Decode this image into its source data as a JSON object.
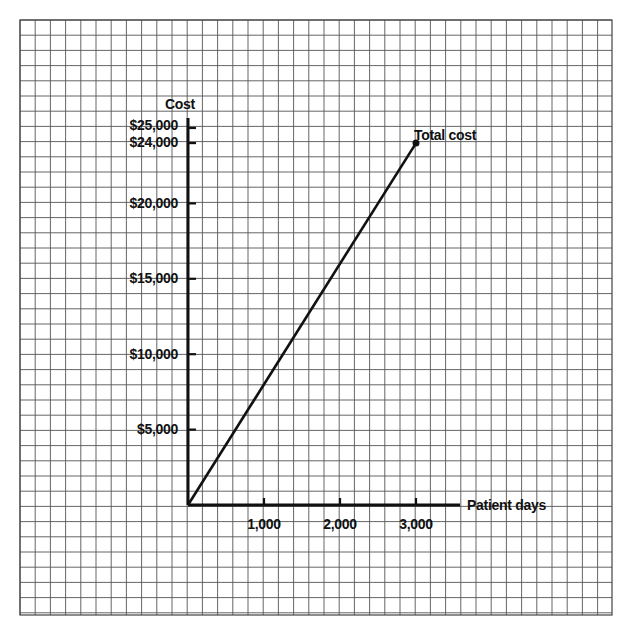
{
  "chart_data": {
    "type": "line",
    "title": "",
    "xlabel": "Patient days",
    "ylabel": "Cost",
    "x_ticks": [
      "1,000",
      "2,000",
      "3,000"
    ],
    "x_tick_values": [
      1000,
      2000,
      3000
    ],
    "y_ticks": [
      "$5,000",
      "$10,000",
      "$15,000",
      "$20,000",
      "$24,000",
      "$25,000"
    ],
    "y_tick_values": [
      5000,
      10000,
      15000,
      20000,
      24000,
      25000
    ],
    "xlim": [
      0,
      3500
    ],
    "ylim": [
      0,
      25000
    ],
    "grid": true,
    "series": [
      {
        "name": "Total cost",
        "x": [
          0,
          3000
        ],
        "y": [
          0,
          24000
        ],
        "endpoint_note": "Endpoint inferred as (3,000, $24,000) from its proximity to the labeled ticks; a direct pixel reading gives roughly (2,850, $24,500)."
      }
    ],
    "annotations": [
      {
        "text": "Total cost",
        "x": 3000,
        "y": 24000
      }
    ]
  },
  "labels": {
    "y_axis_title": "Cost",
    "x_axis_title": "Patient days",
    "series_label": "Total cost",
    "y_ticks": [
      "$25,000",
      "$24,000",
      "$20,000",
      "$15,000",
      "$10,000",
      "$5,000"
    ],
    "x_ticks": [
      "1,000",
      "2,000",
      "3,000"
    ]
  }
}
